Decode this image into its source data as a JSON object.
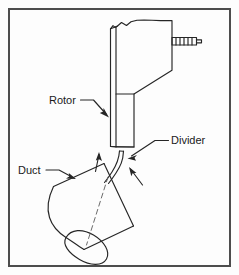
{
  "figure": {
    "kind": "technical-line-drawing",
    "caption_title": "Rotor and duct assembly with divider",
    "background_color": "#fdfdfd",
    "line_color": "#262626",
    "border": {
      "color": "#4d4d4d",
      "inset_px": 8,
      "thickness_px": 2
    }
  },
  "labels": {
    "rotor": "Rotor",
    "divider": "Divider",
    "duct": "Duct"
  },
  "parts": {
    "rotor": {
      "name": "Rotor",
      "description": "Vertical rotor blade with jagged break line at top and threaded stud at right",
      "has_break_line": true
    },
    "divider": {
      "name": "Divider",
      "description": "Thin curved vane between rotor trailing edge and duct mouth"
    },
    "duct": {
      "name": "Duct",
      "description": "Tilted cylindrical duct with dashed centerline and elliptical open end"
    },
    "stud": {
      "name": "Threaded stud",
      "description": "Hatched threaded rod projecting to the right of the rotor"
    }
  },
  "flow_arrows": {
    "count": 2,
    "direction": "upward",
    "description": "Two airflow arrows pointing up from the duct toward the rotor, one each side of the divider"
  }
}
